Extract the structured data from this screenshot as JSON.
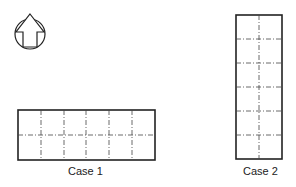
{
  "north_arrow": {
    "icon": "north-arrow-icon"
  },
  "case1": {
    "label": "Case 1",
    "columns": 6,
    "rows": 2
  },
  "case2": {
    "label": "Case 2",
    "columns": 2,
    "rows": 6
  },
  "colors": {
    "line": "#222222",
    "grid": "#444444"
  }
}
